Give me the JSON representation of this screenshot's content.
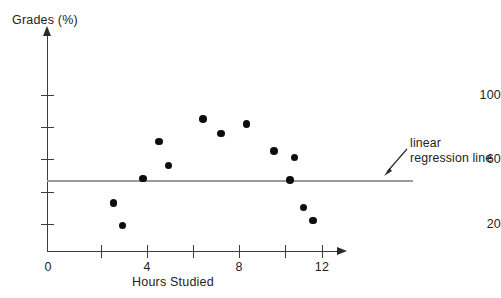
{
  "chart_data": {
    "type": "scatter",
    "title": "",
    "xlabel": "Hours Studied",
    "ylabel": "Grades (%)",
    "xlim": [
      0,
      12.8
    ],
    "ylim": [
      0,
      112
    ],
    "grid": false,
    "x_ticks": [
      0,
      2,
      4,
      6,
      8,
      10,
      12
    ],
    "x_tick_labels": [
      "0",
      "",
      "4",
      "",
      "8",
      "",
      "12"
    ],
    "y_ticks": [
      20,
      40,
      60,
      80,
      100
    ],
    "y_tick_labels": [
      "20",
      "",
      "60",
      "",
      "100"
    ],
    "points": [
      {
        "x": 2.9,
        "y": 33
      },
      {
        "x": 3.3,
        "y": 19
      },
      {
        "x": 4.2,
        "y": 48
      },
      {
        "x": 4.9,
        "y": 71
      },
      {
        "x": 5.3,
        "y": 56
      },
      {
        "x": 6.8,
        "y": 85
      },
      {
        "x": 7.6,
        "y": 76
      },
      {
        "x": 8.7,
        "y": 82
      },
      {
        "x": 9.9,
        "y": 65
      },
      {
        "x": 10.8,
        "y": 61
      },
      {
        "x": 10.6,
        "y": 47
      },
      {
        "x": 11.2,
        "y": 30
      },
      {
        "x": 11.6,
        "y": 22
      }
    ],
    "series": [
      {
        "name": "linear regression line",
        "type": "line",
        "y_value": 47,
        "x_start": 0,
        "x_end": 16
      }
    ],
    "annotations": [
      {
        "name": "regression-line-callout",
        "text_line1": "linear",
        "text_line2": "regression line",
        "arrow": true
      }
    ],
    "colors": {
      "point": "#0d0d0d",
      "axis": "#3c3c3c",
      "regression": "#9a9a9a",
      "text": "#232323",
      "background": "#ffffff"
    }
  }
}
